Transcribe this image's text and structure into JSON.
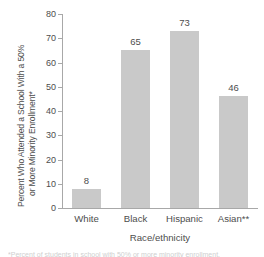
{
  "chart_data": {
    "type": "bar",
    "title": "",
    "categories": [
      "White",
      "Black",
      "Hispanic",
      "Asian**"
    ],
    "values": [
      8,
      65,
      73,
      46
    ],
    "value_labels": [
      "8",
      "65",
      "73",
      "46"
    ],
    "xlabel": "Race/ethnicity",
    "ylabel_line1": "Percent Who Attended a School With a 50%",
    "ylabel_line2": "or More Minority Enrollment*",
    "ylim": [
      0,
      80
    ],
    "yticks": [
      0,
      10,
      20,
      30,
      40,
      50,
      60,
      70,
      80
    ],
    "ytick_labels": [
      "0",
      "10",
      "20",
      "30",
      "40",
      "50",
      "60",
      "70",
      "80"
    ],
    "grid": false,
    "legend": "none",
    "bar_color": "#c9c9c9",
    "axis_color": "#a8a8a8",
    "text_color": "#4d4d4d",
    "background_color": "#ffffff"
  },
  "footnote": {
    "text": "*Percent of students in school with 50% or more minority enrollment."
  }
}
